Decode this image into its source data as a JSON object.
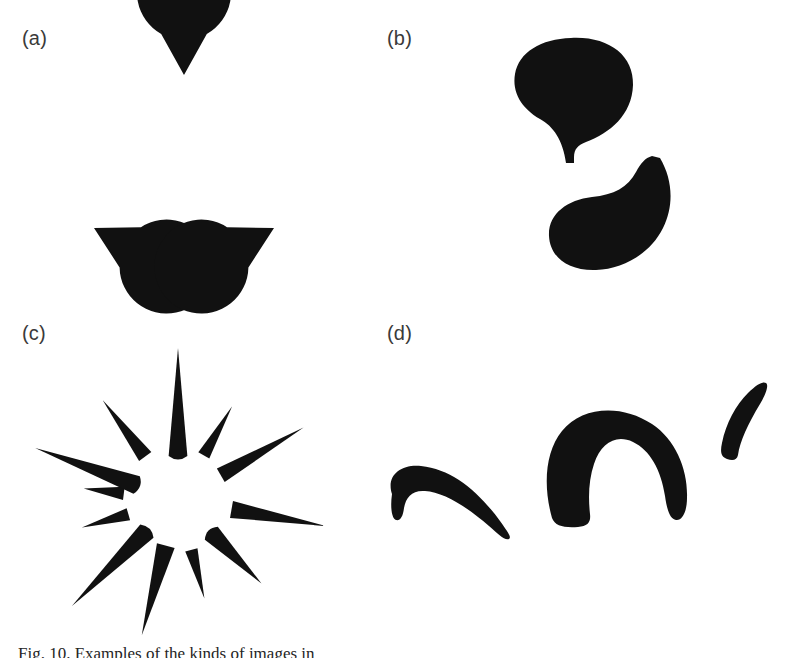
{
  "figure": {
    "caption": "Fig. 10. Examples of the kinds of images in",
    "background_color": "#ffffff",
    "ink_color": "#111111",
    "label_color": "#3a3a3a",
    "width": 797,
    "height": 658
  },
  "panels": [
    {
      "id": "a",
      "label": "(a)",
      "description": "Kanizsa triangle: three pac-man discs with wedges aligned to an illusory triangle",
      "shape_type": "pacman-discs",
      "shape_count": 3,
      "shapes": [
        {
          "name": "pacman-top",
          "cx": 184,
          "cy": 75,
          "r": 47,
          "wedge_center_deg": 90,
          "wedge_span_deg": 58
        },
        {
          "name": "pacman-bottom-left",
          "cx": 94,
          "cy": 228,
          "r": 47,
          "wedge_center_deg": 332,
          "wedge_span_deg": 58
        },
        {
          "name": "pacman-bottom-right",
          "cx": 274,
          "cy": 228,
          "r": 47,
          "wedge_center_deg": 208,
          "wedge_span_deg": 58
        }
      ]
    },
    {
      "id": "b",
      "label": "(b)",
      "description": "Two curved blob shapes with concave notches forming an illusory figure",
      "shape_type": "notched-blobs",
      "shape_count": 2,
      "shapes": [
        {
          "name": "blob-upper",
          "bbox": [
            513,
            38,
            120,
            125
          ]
        },
        {
          "name": "blob-lower",
          "bbox": [
            548,
            158,
            124,
            112
          ]
        }
      ]
    },
    {
      "id": "c",
      "label": "(c)",
      "description": "Radial starburst of tapered cones and spikes surrounding an illusory circle",
      "shape_type": "radial-spikes",
      "shape_count": 12,
      "center": [
        178,
        500
      ],
      "illusory_radius": 52,
      "shapes": [
        {
          "name": "spike-1",
          "angle_deg": 90,
          "inner_r": 45,
          "outer_r": 152,
          "half_width_deg": 12,
          "rounded_base": true
        },
        {
          "name": "spike-2",
          "angle_deg": 60,
          "inner_r": 52,
          "outer_r": 108,
          "half_width_deg": 7,
          "rounded_base": false
        },
        {
          "name": "spike-3",
          "angle_deg": 30,
          "inner_r": 50,
          "outer_r": 145,
          "half_width_deg": 9,
          "rounded_base": false
        },
        {
          "name": "spike-4",
          "angle_deg": 350,
          "inner_r": 55,
          "outer_r": 150,
          "half_width_deg": 9,
          "rounded_base": false
        },
        {
          "name": "spike-5",
          "angle_deg": 315,
          "inner_r": 48,
          "outer_r": 118,
          "half_width_deg": 11,
          "rounded_base": true
        },
        {
          "name": "spike-6",
          "angle_deg": 285,
          "inner_r": 52,
          "outer_r": 102,
          "half_width_deg": 7,
          "rounded_base": false
        },
        {
          "name": "spike-7",
          "angle_deg": 255,
          "inner_r": 48,
          "outer_r": 140,
          "half_width_deg": 11,
          "rounded_base": false
        },
        {
          "name": "spike-8",
          "angle_deg": 225,
          "inner_r": 45,
          "outer_r": 150,
          "half_width_deg": 12,
          "rounded_base": true
        },
        {
          "name": "spike-9",
          "angle_deg": 196,
          "inner_r": 52,
          "outer_r": 100,
          "half_width_deg": 7,
          "rounded_base": false
        },
        {
          "name": "spike-10",
          "angle_deg": 173,
          "inner_r": 55,
          "outer_r": 95,
          "half_width_deg": 7,
          "rounded_base": false
        },
        {
          "name": "spike-11",
          "angle_deg": 160,
          "inner_r": 45,
          "outer_r": 152,
          "half_width_deg": 12,
          "rounded_base": true
        },
        {
          "name": "spike-12",
          "angle_deg": 127,
          "inner_r": 55,
          "outer_r": 125,
          "half_width_deg": 8,
          "rounded_base": false
        }
      ]
    },
    {
      "id": "d",
      "label": "(d)",
      "description": "Three curved crescent arcs of decreasing size",
      "shape_type": "crescent-arcs",
      "shape_count": 3,
      "shapes": [
        {
          "name": "arc-large",
          "bbox": [
            388,
            464,
            126,
            74
          ],
          "rotation_deg": 14,
          "thickness": 30
        },
        {
          "name": "arc-medium",
          "bbox": [
            546,
            416,
            142,
            110
          ],
          "rotation_deg": -2,
          "thickness": 34
        },
        {
          "name": "arc-small",
          "bbox": [
            720,
            382,
            50,
            76
          ],
          "rotation_deg": 0,
          "thickness": 20
        }
      ]
    }
  ]
}
